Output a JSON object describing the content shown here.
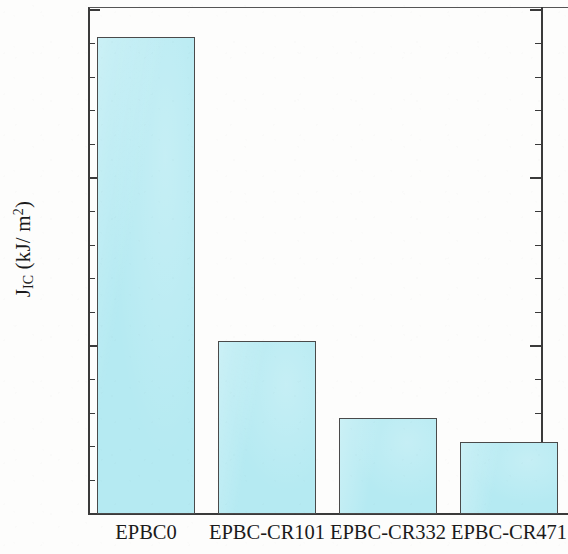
{
  "chart_data": {
    "type": "bar",
    "title": "",
    "xlabel": "",
    "ylabel": "J_IC (kJ/m^2)",
    "ylabel_parts": {
      "main": "J",
      "subscript": "IC",
      "unit_open": " (kJ/ m",
      "unit_sup": "2",
      "unit_close": ")"
    },
    "categories": [
      "EPBC0",
      "EPBC-CR101",
      "EPBC-CR332",
      "EPBC-CR471"
    ],
    "values": [
      14.2,
      5.15,
      2.85,
      2.15
    ],
    "ylim": [
      0,
      15
    ],
    "ytick_labels": [
      "0",
      "5",
      "10",
      "15"
    ],
    "ytick_values": [
      0,
      5,
      10,
      15
    ],
    "minor_tick_step": 1,
    "grid": false,
    "legend": null,
    "bar_fill_color": "#b5eaf2",
    "bar_edge_color": "#4a4a4a",
    "axis_color": "#3a3a3a",
    "background_color": "#fdfdfc"
  }
}
